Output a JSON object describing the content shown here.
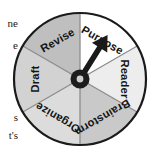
{
  "figure": {
    "name": "writing-process-wheel",
    "type": "spinner-wheel-diagram",
    "segment_count": 6,
    "pointer_target": "Purpose"
  },
  "wheel": {
    "center_x": 80,
    "center_y": 79,
    "radius": 66,
    "rim_color": "#1a1a1a",
    "spoke_color": "#8c8c8c",
    "hub_outer_color": "#1d1d1d",
    "hub_inner_color": "#cfcfcf",
    "arrow_color": "#1a1a1a",
    "segments": [
      {
        "id": "purpose",
        "label": "Purpose",
        "start_deg": -90,
        "end_deg": -30,
        "fill": "#ffffff",
        "label_angle_deg": -60,
        "label_radius": 45,
        "text_rotate": 30
      },
      {
        "id": "reader",
        "label": "Reader",
        "start_deg": -30,
        "end_deg": 30,
        "fill": "#ededed",
        "label_angle_deg": 0,
        "label_radius": 45,
        "text_rotate": 90
      },
      {
        "id": "brainstorm",
        "label": "Brainstorm",
        "start_deg": 30,
        "end_deg": 90,
        "fill": "#c9c9c9",
        "label_angle_deg": 60,
        "label_radius": 45,
        "text_rotate": 150
      },
      {
        "id": "organize",
        "label": "Organize",
        "start_deg": 90,
        "end_deg": 150,
        "fill": "#dcdcdc",
        "label_angle_deg": 120,
        "label_radius": 45,
        "text_rotate": 210
      },
      {
        "id": "draft",
        "label": "Draft",
        "start_deg": 150,
        "end_deg": 210,
        "fill": "#d2d2d2",
        "label_angle_deg": 180,
        "label_radius": 45,
        "text_rotate": 270
      },
      {
        "id": "revise",
        "label": "Revise",
        "start_deg": 210,
        "end_deg": 270,
        "fill": "#bfbfbf",
        "label_angle_deg": 240,
        "label_radius": 45,
        "text_rotate": 330
      }
    ]
  },
  "margin_text": {
    "line_1": "ne",
    "line_2": "e",
    "line_3": "s",
    "line_4": "t's"
  }
}
